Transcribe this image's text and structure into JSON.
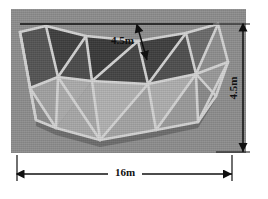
{
  "figure": {
    "name": "geodesic-dome-photo",
    "caption": ""
  },
  "colors": {
    "page_background": "#ffffff",
    "photo_background": "#8e8e8e",
    "panel_dark": "#4a4a4a",
    "panel_mid": "#6f6f6f",
    "panel_light": "#a6a6a6",
    "panel_pale": "#b8b8b8",
    "strut": "#d2d2d2",
    "strut_shadow": "#6a6a6a",
    "dimension_line": "#101010",
    "dimension_text": "#111111"
  },
  "dimensions": [
    {
      "id": "top-band-depth",
      "label": "4.5m",
      "orientation": "slanted",
      "description": "depth of the upper band measured from the top chord"
    },
    {
      "id": "overall-height",
      "label": "4.5m",
      "orientation": "vertical",
      "description": "overall height of the dome shell at the right edge"
    },
    {
      "id": "overall-width",
      "label": "16m",
      "orientation": "horizontal",
      "description": "overall span of the dome measured across the base"
    }
  ],
  "annotations": {
    "top_label": "4.5m",
    "right_label": "4.5m",
    "bottom_label": "16m"
  }
}
